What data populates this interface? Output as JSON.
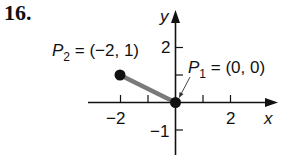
{
  "problem_number": "16.",
  "diagram": {
    "type": "coordinate-plane-segment",
    "x_axis_label": "x",
    "y_axis_label": "y",
    "x_ticks": [
      -2,
      -1,
      0,
      1,
      2
    ],
    "x_tick_labels": [
      "−2",
      "2"
    ],
    "y_tick_labels": [
      "2",
      "−1"
    ],
    "points": [
      {
        "name": "P",
        "subscript": "2",
        "text": " = (−2, 1)",
        "x": -2,
        "y": 1
      },
      {
        "name": "P",
        "subscript": "1",
        "text": " = (0, 0)",
        "x": 0,
        "y": 0
      }
    ],
    "segment": {
      "from": "P2",
      "to": "P1",
      "color": "#7a7a7a"
    },
    "axis_color": "#111111"
  }
}
